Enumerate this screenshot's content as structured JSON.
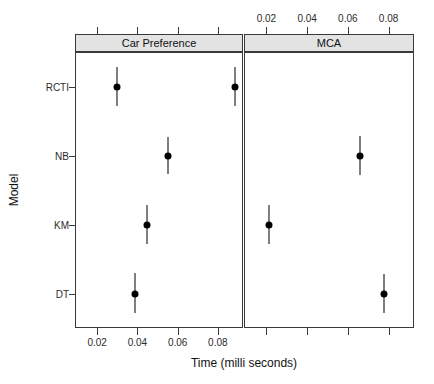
{
  "chart_data": {
    "type": "scatter",
    "title": "",
    "xlabel": "Time (milli seconds)",
    "ylabel": "Model",
    "grid": false,
    "legend": "none",
    "orientation": "horizontal-dotplot-with-error-bars",
    "categories": [
      "RCTI",
      "NB",
      "KM",
      "DT"
    ],
    "category_order_top_to_bottom": [
      "RCTI",
      "NB",
      "KM",
      "DT"
    ],
    "xlim": [
      0.009,
      0.092
    ],
    "xticks": [
      0.02,
      0.04,
      0.06,
      0.08
    ],
    "xticklabels": [
      "0.02",
      "0.04",
      "0.06",
      "0.08"
    ],
    "panels": [
      {
        "name": "Car Preference",
        "axis_labels_position": "bottom",
        "points": [
          {
            "category": "RCTI",
            "x": 0.03,
            "low": 0.0255,
            "high": 0.0348
          },
          {
            "category": "NB",
            "x": 0.0553,
            "low": 0.0508,
            "high": 0.06
          },
          {
            "category": "KM",
            "x": 0.0448,
            "low": 0.04,
            "high": 0.0495
          },
          {
            "category": "DT",
            "x": 0.039,
            "low": 0.034,
            "high": 0.0437
          }
        ]
      },
      {
        "name": "MCA",
        "axis_labels_position": "top",
        "points": [
          {
            "category": "RCTI",
            "x": 0.0045,
            "low": 0.0,
            "high": 0.0092
          },
          {
            "category": "NB",
            "x": 0.066,
            "low": 0.0612,
            "high": 0.0707
          },
          {
            "category": "KM",
            "x": 0.0212,
            "low": 0.0165,
            "high": 0.026
          },
          {
            "category": "DT",
            "x": 0.078,
            "low": 0.0733,
            "high": 0.0828
          }
        ]
      }
    ]
  },
  "colors": {
    "point": "#000000",
    "error_bar": "#000000",
    "panel_border": "#3a3a3a",
    "strip_fill": "#e3e3e3",
    "background": "#ffffff",
    "tick_text": "#2b2b2b"
  },
  "axes": {
    "x_title": "Time (milli seconds)",
    "y_title": "Model",
    "y_categories": [
      "RCTI",
      "NB",
      "KM",
      "DT"
    ],
    "x_tick_labels": [
      "0.02",
      "0.04",
      "0.06",
      "0.08"
    ]
  },
  "strips": {
    "left": "Car Preference",
    "right": "MCA"
  }
}
